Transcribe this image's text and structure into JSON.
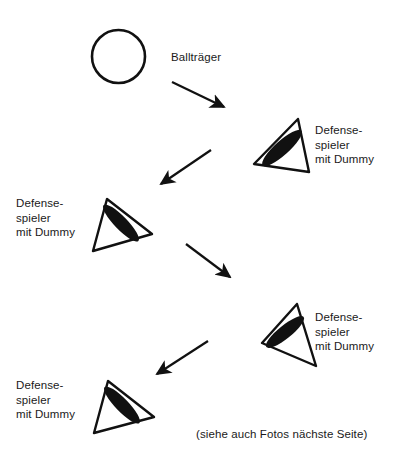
{
  "figure": {
    "type": "tactical-drill-diagram",
    "background_color": "#ffffff",
    "ink_color": "#111111"
  },
  "labels": {
    "ball_carrier": "Ballträger",
    "defender_1": "Defense-\nspieler\nmit Dummy",
    "defender_2": "Defense-\nspieler\nmit Dummy",
    "defender_3": "Defense-\nspieler\nmit Dummy",
    "defender_4": "Defense-\nspieler\nmit Dummy",
    "footnote": "(siehe auch Fotos nächste Seite)"
  },
  "shapes": {
    "ball_carrier_circle": {
      "name": "circle",
      "cx": 118.5,
      "cy": 56.5,
      "r": 26.5,
      "stroke_width": 2.6
    },
    "defenders": [
      {
        "name": "defender-triangle-1",
        "orientation": "apex-top-right",
        "points": "298,119 254,164 309,172",
        "dummy": {
          "cx": 282,
          "cy": 148,
          "rx": 26,
          "ry": 7,
          "rotation": -42
        }
      },
      {
        "name": "defender-triangle-2",
        "orientation": "apex-top-left",
        "points": "107,199 93,251 152,234",
        "dummy": {
          "cx": 121,
          "cy": 223,
          "rx": 25,
          "ry": 6.5,
          "rotation": 46
        }
      },
      {
        "name": "defender-triangle-3",
        "orientation": "apex-top-right",
        "points": "297,304 262,343 316,366",
        "dummy": {
          "cx": 285,
          "cy": 332,
          "rx": 24,
          "ry": 6.5,
          "rotation": -39
        }
      },
      {
        "name": "defender-triangle-4",
        "orientation": "apex-top-left",
        "points": "108,381 94,433 154,417",
        "dummy": {
          "cx": 122,
          "cy": 405,
          "rx": 25,
          "ry": 6.5,
          "rotation": 46
        }
      }
    ],
    "arrows": [
      {
        "name": "arrow-1",
        "x1": 172,
        "y1": 82,
        "x2": 228,
        "y2": 110,
        "direction": "down-right"
      },
      {
        "name": "arrow-2",
        "x1": 211,
        "y1": 150,
        "x2": 157,
        "y2": 187,
        "direction": "down-left"
      },
      {
        "name": "arrow-3",
        "x1": 186,
        "y1": 244,
        "x2": 234,
        "y2": 281,
        "direction": "down-right"
      },
      {
        "name": "arrow-4",
        "x1": 208,
        "y1": 341,
        "x2": 153,
        "y2": 377,
        "direction": "down-left"
      }
    ]
  },
  "label_positions": {
    "ball_carrier": {
      "left": 171,
      "top": 50
    },
    "defender_1": {
      "left": 315,
      "top": 123
    },
    "defender_2": {
      "left": 16,
      "top": 196
    },
    "defender_3": {
      "left": 315,
      "top": 310
    },
    "defender_4": {
      "left": 16,
      "top": 378
    },
    "footnote": {
      "left": 196,
      "top": 427
    }
  }
}
